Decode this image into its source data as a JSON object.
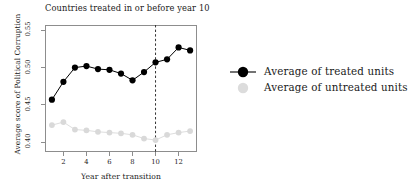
{
  "chart_data": {
    "type": "line",
    "title": "Countries treated in or before year 10",
    "xlabel": "Year after transition",
    "ylabel": "Average score of Political Corruption",
    "x": [
      1,
      2,
      3,
      4,
      5,
      6,
      7,
      8,
      9,
      10,
      11,
      12,
      13
    ],
    "xlim": [
      0.4,
      13.6
    ],
    "ylim": [
      0.387,
      0.557
    ],
    "xticks": [
      2,
      4,
      6,
      8,
      10,
      12
    ],
    "xtick_labels": [
      "2",
      "4",
      "6",
      "8",
      "10",
      "12"
    ],
    "yticks": [
      0.4,
      0.45,
      0.5,
      0.55
    ],
    "ytick_labels": [
      "0.40",
      "0.45",
      "0.50",
      "0.55"
    ],
    "grid": false,
    "legend_position": "right",
    "series": [
      {
        "name": "Average of treated units",
        "color": "#000000",
        "marker": "filled-circle",
        "line": true,
        "values": [
          0.457,
          0.481,
          0.5,
          0.502,
          0.498,
          0.497,
          0.492,
          0.483,
          0.494,
          0.507,
          0.511,
          0.527,
          0.523
        ]
      },
      {
        "name": "Average of untreated units",
        "color": "#d9d9d9",
        "marker": "filled-circle",
        "line": true,
        "values": [
          0.423,
          0.427,
          0.417,
          0.416,
          0.414,
          0.413,
          0.412,
          0.41,
          0.405,
          0.403,
          0.41,
          0.413,
          0.415
        ]
      }
    ],
    "annotations": [
      {
        "type": "vertical-dashed-line",
        "x": 10,
        "color": "#333333",
        "label": "treatment cutoff at year 10"
      }
    ]
  },
  "legend": {
    "items": [
      {
        "label": "Average of treated units",
        "color": "#000000",
        "has_line": true
      },
      {
        "label": "Average of untreated units",
        "color": "#dcdcdc",
        "has_line": false
      }
    ]
  }
}
